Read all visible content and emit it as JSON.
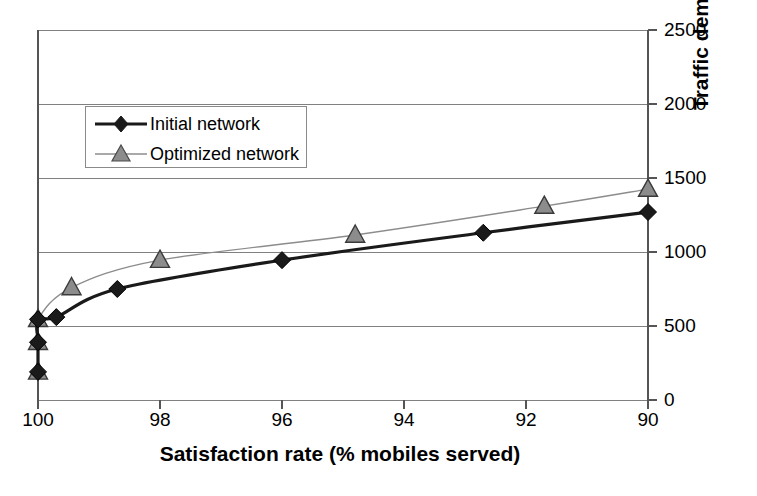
{
  "chart_data": {
    "type": "line",
    "title": "",
    "xlabel": "Satisfaction rate (% mobiles served)",
    "ylabel": "Traffic demand",
    "xlim": [
      100,
      90
    ],
    "ylim": [
      0,
      2500
    ],
    "x_ticks": [
      100,
      98,
      96,
      94,
      92,
      90
    ],
    "x_tick_labels": [
      "100",
      "98",
      "96",
      "94",
      "92",
      "90"
    ],
    "y_ticks": [
      0,
      500,
      1000,
      1500,
      2000,
      2500
    ],
    "y_tick_labels": [
      "0",
      "500",
      "1000",
      "1500",
      "2000",
      "2500"
    ],
    "x_axis_inverted": true,
    "y_axis_position": "right",
    "grid": true,
    "grid_axis": "y",
    "legend_position": "upper left",
    "series": [
      {
        "name": "Initial network",
        "marker": "diamond",
        "color": "#1a1a1a",
        "line_width": 3.2,
        "x": [
          100.0,
          100.0,
          100.0,
          99.7,
          98.7,
          96.0,
          92.7,
          90.0
        ],
        "y": [
          190,
          390,
          545,
          560,
          750,
          945,
          1130,
          1270
        ]
      },
      {
        "name": "Optimized network",
        "marker": "triangle",
        "color": "#8c8c8c",
        "line_width": 1.4,
        "x": [
          100.0,
          100.0,
          100.0,
          99.45,
          98.0,
          94.8,
          91.7,
          90.0
        ],
        "y": [
          190,
          390,
          545,
          760,
          945,
          1115,
          1310,
          1425
        ]
      }
    ]
  },
  "legend": {
    "items": [
      {
        "label": "Initial network",
        "marker": "diamond-marker-icon"
      },
      {
        "label": "Optimized network",
        "marker": "triangle-marker-icon"
      }
    ]
  },
  "colors": {
    "initial_network": "#1a1a1a",
    "optimized_network": "#8c8c8c",
    "axis": "#555555",
    "grid": "#808080",
    "background": "#ffffff"
  }
}
